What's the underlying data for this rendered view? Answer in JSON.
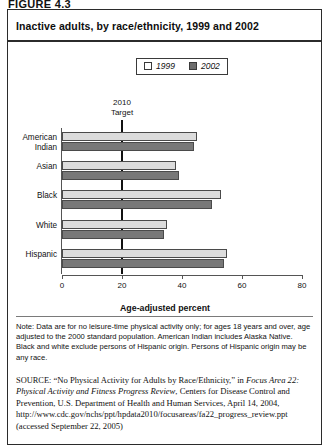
{
  "figure": {
    "label": "FIGURE 4.3"
  },
  "chart": {
    "title": "Inactive adults, by race/ethnicity, 1999 and 2002",
    "axis_title": "Age-adjusted percent",
    "target_annotation_line1": "2010",
    "target_annotation_line2": "Target"
  },
  "legend": {
    "items": [
      {
        "label": "1999",
        "swatch": "hollow-square",
        "color": "#ffffff"
      },
      {
        "label": "2002",
        "swatch": "filled-square",
        "color": "#6d6d6d"
      }
    ]
  },
  "notes": {
    "note_text": "Note: Data are for no leisure-time physical activity only; for ages 18 years and over, age adjusted to the 2000 standard population. American Indian includes Alaska Native. Black and white exclude persons of Hispanic origin. Persons of Hispanic origin may be any race.",
    "source_label": "SOURCE:",
    "source_part1": "“No Physical Activity for Adults by Race/Ethnicity,” in ",
    "source_italic1": "Focus Area 22: Physical Activity and Fitness Progress Review",
    "source_part2": ", Centers for Disease Control and Prevention, U.S. Department of Health and Human Services, April 14, 2004, http://www.cdc.gov/nchs/ppt/hpdata2010/focusareas/fa22_progress_review.ppt (accessed September 22, 2005)"
  },
  "chart_data": {
    "type": "bar",
    "orientation": "horizontal",
    "title": "Inactive adults, by race/ethnicity, 1999 and 2002",
    "xlabel": "Age-adjusted percent",
    "ylabel": "",
    "xlim": [
      0,
      80
    ],
    "xticks": [
      0,
      20,
      40,
      60,
      80
    ],
    "grid": false,
    "legend_position": "top-right",
    "categories": [
      "American Indian",
      "Asian",
      "Black",
      "White",
      "Hispanic"
    ],
    "series": [
      {
        "name": "1999",
        "color": "#dcdcdc",
        "values": [
          45,
          38,
          53,
          35,
          55
        ]
      },
      {
        "name": "2002",
        "color": "#787878",
        "values": [
          44,
          39,
          50,
          34,
          54
        ]
      }
    ],
    "annotations": [
      {
        "type": "vline",
        "value": 20,
        "label": "2010 Target"
      }
    ]
  }
}
